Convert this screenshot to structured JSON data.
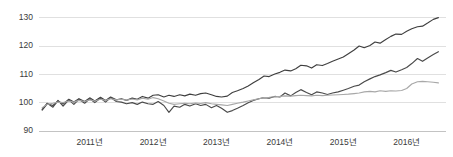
{
  "chart_data": {
    "type": "line",
    "title": "",
    "subtitle": "",
    "xlabel": "",
    "ylabel": "",
    "xlim": [
      2010.2,
      2016.62
    ],
    "ylim": [
      90,
      132
    ],
    "grid": true,
    "grid_axis": "y",
    "legend": "none",
    "y_ticks": [
      90,
      100,
      110,
      120,
      130
    ],
    "y_tick_labels": [
      "90",
      "100",
      "110",
      "120",
      "130"
    ],
    "x_ticks": [
      2011,
      2012,
      2013,
      2014,
      2015,
      2016
    ],
    "x_tick_labels": [
      "2011년",
      "2012년",
      "2013년",
      "2014년",
      "2015년",
      "2016년"
    ],
    "colors": {
      "series_1": "#3f3f3f",
      "series_2": "#4a4a4a",
      "series_3": "#a8a8a8",
      "gridline": "#d8d8d8",
      "axis": "#bdbdbd",
      "tick_text": "#3a3a3a",
      "background": "#ffffff"
    },
    "x": [
      2010.25,
      2010.33,
      2010.42,
      2010.5,
      2010.58,
      2010.67,
      2010.75,
      2010.83,
      2010.92,
      2011.0,
      2011.08,
      2011.17,
      2011.25,
      2011.33,
      2011.42,
      2011.5,
      2011.58,
      2011.67,
      2011.75,
      2011.83,
      2011.92,
      2012.0,
      2012.08,
      2012.17,
      2012.25,
      2012.33,
      2012.42,
      2012.5,
      2012.58,
      2012.67,
      2012.75,
      2012.83,
      2012.92,
      2013.0,
      2013.08,
      2013.17,
      2013.25,
      2013.33,
      2013.42,
      2013.5,
      2013.58,
      2013.67,
      2013.75,
      2013.83,
      2013.92,
      2014.0,
      2014.08,
      2014.17,
      2014.25,
      2014.33,
      2014.42,
      2014.5,
      2014.58,
      2014.67,
      2014.75,
      2014.83,
      2014.92,
      2015.0,
      2015.08,
      2015.17,
      2015.25,
      2015.33,
      2015.42,
      2015.5,
      2015.58,
      2015.67,
      2015.75,
      2015.83,
      2015.92,
      2016.0,
      2016.08,
      2016.17,
      2016.25,
      2016.33,
      2016.42,
      2016.5
    ],
    "series": [
      {
        "name": "series_1",
        "color": "#3f3f3f",
        "values": [
          97.4,
          99.6,
          99.0,
          100.6,
          99.5,
          101.2,
          100.2,
          101.4,
          100.4,
          101.7,
          100.6,
          101.9,
          100.8,
          102.0,
          101.0,
          101.4,
          100.8,
          101.6,
          101.2,
          102.2,
          101.6,
          102.6,
          102.8,
          102.0,
          102.6,
          102.2,
          102.8,
          102.4,
          103.0,
          102.6,
          103.2,
          103.4,
          102.8,
          102.2,
          102.0,
          102.3,
          103.6,
          104.2,
          105.0,
          105.9,
          107.0,
          108.2,
          109.4,
          109.2,
          110.1,
          110.7,
          111.5,
          111.2,
          112.0,
          113.2,
          113.0,
          112.2,
          113.4,
          113.1,
          113.8,
          114.6,
          115.4,
          116.1,
          117.3,
          118.6,
          120.0,
          119.4,
          120.2,
          121.4,
          121.0,
          122.3,
          123.4,
          124.2,
          124.1,
          125.2,
          126.1,
          126.8,
          127.0,
          128.1,
          129.4,
          130.0
        ]
      },
      {
        "name": "series_2",
        "color": "#4a4a4a",
        "values": [
          97.6,
          99.8,
          98.4,
          100.8,
          98.8,
          101.0,
          99.4,
          101.2,
          99.8,
          101.4,
          100.0,
          101.6,
          100.2,
          101.8,
          100.4,
          100.2,
          99.6,
          100.0,
          99.4,
          100.2,
          99.6,
          99.4,
          100.4,
          99.0,
          96.6,
          98.8,
          98.4,
          99.4,
          98.8,
          99.6,
          99.0,
          99.4,
          98.2,
          99.0,
          98.0,
          96.6,
          97.2,
          98.0,
          99.0,
          100.0,
          100.8,
          101.4,
          101.8,
          101.6,
          102.2,
          102.0,
          103.4,
          102.4,
          103.6,
          104.6,
          103.6,
          102.8,
          103.8,
          103.4,
          102.9,
          103.4,
          103.8,
          104.4,
          105.0,
          105.8,
          106.2,
          107.4,
          108.4,
          109.2,
          109.8,
          110.6,
          111.4,
          110.8,
          111.6,
          112.4,
          113.8,
          115.6,
          114.6,
          115.8,
          117.0,
          118.0
        ]
      },
      {
        "name": "series_3",
        "color": "#a8a8a8",
        "values": [
          98.2,
          99.4,
          99.8,
          100.2,
          100.0,
          100.6,
          100.2,
          100.8,
          100.4,
          101.0,
          100.6,
          101.2,
          100.8,
          101.4,
          101.0,
          101.2,
          100.9,
          101.3,
          101.0,
          101.6,
          101.2,
          101.8,
          101.4,
          100.6,
          99.8,
          99.4,
          99.6,
          99.8,
          99.6,
          99.9,
          99.7,
          100.0,
          99.6,
          99.4,
          99.2,
          99.0,
          99.4,
          99.8,
          100.2,
          100.6,
          101.0,
          101.4,
          101.8,
          101.9,
          102.1,
          102.2,
          102.4,
          102.3,
          102.5,
          102.6,
          102.5,
          102.4,
          102.6,
          102.5,
          102.6,
          102.7,
          102.8,
          102.9,
          103.0,
          103.2,
          103.4,
          103.8,
          104.0,
          103.8,
          104.2,
          104.0,
          104.2,
          104.1,
          104.3,
          105.0,
          106.6,
          107.4,
          107.5,
          107.4,
          107.2,
          107.0
        ]
      }
    ]
  }
}
